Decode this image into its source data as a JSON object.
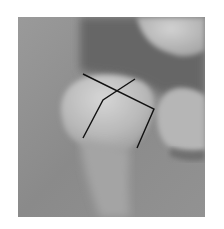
{
  "image": {
    "subject": "dental radiograph",
    "description": "Periapical X-ray of a lower molar with two overlaid angle-measurement lines",
    "colors": {
      "background": "#ffffff",
      "bone": "#8e8e8e",
      "soft_tissue_dark": "#5e5e5e",
      "tooth_light": "#c4c4c4",
      "annotation_line": "#111111"
    }
  },
  "annotations": [
    {
      "name": "occlusal-axis-line-a",
      "points": [
        [
          83,
          74
        ],
        [
          154,
          109
        ],
        [
          137,
          148
        ]
      ]
    },
    {
      "name": "occlusal-axis-line-b",
      "points": [
        [
          135,
          79
        ],
        [
          103,
          100
        ],
        [
          83,
          138
        ]
      ]
    }
  ]
}
